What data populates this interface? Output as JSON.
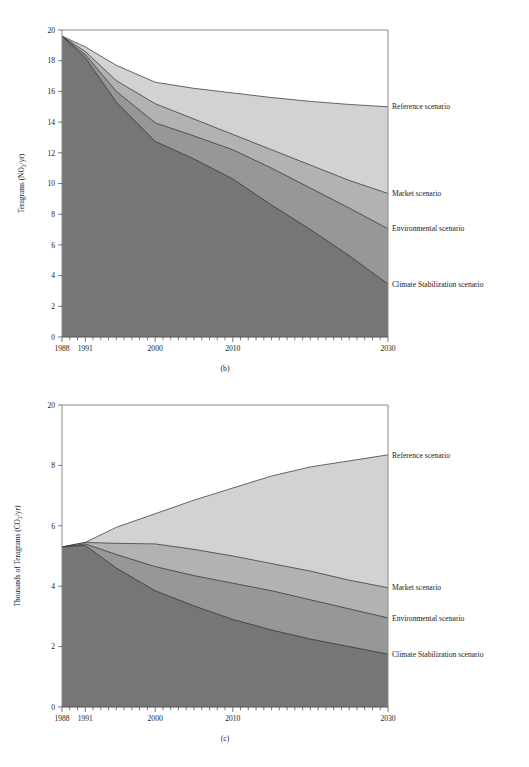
{
  "figure": {
    "panels": [
      {
        "id": "b",
        "subcaption": "(b)",
        "ylabel": "Teragrams (NO₂/yr)",
        "xlabel": ""
      },
      {
        "id": "c",
        "subcaption": "(c)",
        "ylabel": "Thousands of Teragrams (CO₂/yr)",
        "xlabel": ""
      }
    ]
  },
  "colors": {
    "reference_band": "#d2d2d2",
    "market_band": "#b2b2b2",
    "environmental_band": "#979797",
    "climate_band": "#767676",
    "edge": "#2b2b2b",
    "frame": "#8a8a8a",
    "text": "#1a1a1a",
    "background": "#ffffff"
  },
  "chart_data": [
    {
      "type": "area",
      "panel": "b",
      "title": "",
      "subtitle": "(b)",
      "xlabel": "",
      "ylabel": "Teragrams (NO₂/yr)",
      "xlim": [
        1988,
        2030
      ],
      "ylim": [
        0,
        20
      ],
      "xticks": [
        1988,
        1991,
        2000,
        2010,
        2030
      ],
      "xtick_labels": [
        "1988",
        "1991",
        "2000",
        "2010",
        "2030"
      ],
      "xminor_tick_interval": 1,
      "yticks": [
        0,
        2,
        4,
        6,
        8,
        10,
        12,
        14,
        16,
        18,
        20
      ],
      "ytick_labels": [
        "0",
        "2",
        "4",
        "6",
        "8",
        "10",
        "12",
        "14",
        "16",
        "18",
        "20"
      ],
      "grid": false,
      "legend_position": "right-inline",
      "stacking": "overlaid-descending",
      "x": [
        1988,
        1991,
        1995,
        2000,
        2005,
        2010,
        2015,
        2020,
        2025,
        2030
      ],
      "series": [
        {
          "name": "Reference scenario",
          "fill": "#d2d2d2",
          "values": [
            19.6,
            18.9,
            17.7,
            16.6,
            16.2,
            15.9,
            15.6,
            15.35,
            15.15,
            15.0
          ],
          "label_value_2030": 15.0
        },
        {
          "name": "Market scenario",
          "fill": "#b2b2b2",
          "values": [
            19.6,
            18.6,
            16.7,
            15.2,
            14.2,
            13.2,
            12.2,
            11.2,
            10.2,
            9.35
          ],
          "label_value_2030": 9.35
        },
        {
          "name": "Environmental scenario",
          "fill": "#979797",
          "values": [
            19.6,
            18.4,
            16.0,
            13.95,
            13.1,
            12.2,
            11.0,
            9.7,
            8.4,
            7.05
          ],
          "label_value_2030": 7.05
        },
        {
          "name": "Climate Stabilization scenario",
          "fill": "#767676",
          "values": [
            19.6,
            18.2,
            15.3,
            12.75,
            11.6,
            10.3,
            8.6,
            7.0,
            5.3,
            3.45
          ],
          "label_value_2030": 3.45
        }
      ],
      "annotations": [
        {
          "text": "Reference scenario",
          "x": 2030,
          "y": 15.0
        },
        {
          "text": "Market scenario",
          "x": 2030,
          "y": 9.35
        },
        {
          "text": "Environmental scenario",
          "x": 2030,
          "y": 7.05
        },
        {
          "text": "Climate Stabilization scenario",
          "x": 2030,
          "y": 3.45
        }
      ]
    },
    {
      "type": "area",
      "panel": "c",
      "title": "",
      "subtitle": "(c)",
      "xlabel": "",
      "ylabel": "Thousands of Teragrams (CO₂/yr)",
      "xlim": [
        1988,
        2030
      ],
      "ylim": [
        0,
        10
      ],
      "xticks": [
        1988,
        1991,
        2000,
        2010,
        2030
      ],
      "xtick_labels": [
        "1988",
        "1991",
        "2000",
        "2010",
        "2030"
      ],
      "xminor_tick_interval": 1,
      "yticks": [
        0,
        2,
        4,
        6,
        8,
        10
      ],
      "ytick_labels": [
        "0",
        "2",
        "4",
        "6",
        "8",
        "20"
      ],
      "grid": false,
      "legend_position": "right-inline",
      "stacking": "overlaid-descending",
      "x": [
        1988,
        1991,
        1995,
        2000,
        2005,
        2010,
        2015,
        2020,
        2025,
        2030
      ],
      "series": [
        {
          "name": "Reference scenario",
          "fill": "#d2d2d2",
          "values": [
            5.3,
            5.45,
            5.95,
            6.4,
            6.85,
            7.25,
            7.65,
            7.95,
            8.15,
            8.35
          ],
          "label_value_2030": 8.35
        },
        {
          "name": "Market scenario",
          "fill": "#b2b2b2",
          "values": [
            5.3,
            5.45,
            5.42,
            5.4,
            5.22,
            5.0,
            4.75,
            4.5,
            4.2,
            3.95
          ],
          "label_value_2030": 3.95
        },
        {
          "name": "Environmental scenario",
          "fill": "#979797",
          "values": [
            5.3,
            5.4,
            5.05,
            4.65,
            4.35,
            4.1,
            3.85,
            3.55,
            3.25,
            2.95
          ],
          "label_value_2030": 2.95
        },
        {
          "name": "Climate Stabilization scenario",
          "fill": "#767676",
          "values": [
            5.3,
            5.35,
            4.6,
            3.85,
            3.35,
            2.9,
            2.55,
            2.25,
            2.0,
            1.75
          ],
          "label_value_2030": 1.75
        }
      ],
      "annotations": [
        {
          "text": "Reference scenario",
          "x": 2030,
          "y": 8.35
        },
        {
          "text": "Market scenario",
          "x": 2030,
          "y": 3.95
        },
        {
          "text": "Environmental scenario",
          "x": 2030,
          "y": 2.95
        },
        {
          "text": "Climate Stabilization scenario",
          "x": 2030,
          "y": 1.75
        }
      ]
    }
  ]
}
